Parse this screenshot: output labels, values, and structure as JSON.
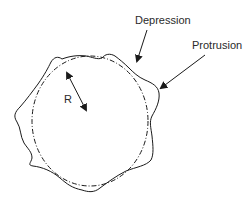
{
  "diagram": {
    "labels": {
      "depression": "Depression",
      "protrusion": "Protrusion",
      "radius": "R"
    },
    "colors": {
      "stroke": "#1a1a1a",
      "text": "#2a2a2a",
      "background": "#ffffff"
    },
    "elements": {
      "reference_circle": {
        "style": "dash-dot",
        "cx": 90,
        "cy": 121,
        "rx": 58,
        "ry": 65
      },
      "irregular_outline": {
        "style": "solid"
      },
      "radius_arrow": {
        "style": "double-headed",
        "from": [
          65,
          70
        ],
        "to": [
          88,
          113
        ]
      },
      "depression_arrow": {
        "from": [
          147,
          30
        ],
        "to": [
          136,
          64
        ]
      },
      "protrusion_arrow": {
        "from": [
          205,
          55
        ],
        "to": [
          158,
          90
        ]
      }
    }
  }
}
